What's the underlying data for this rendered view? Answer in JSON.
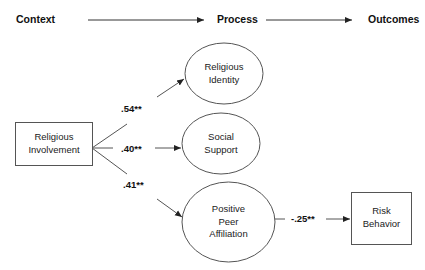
{
  "header": {
    "stages": [
      {
        "label": "Context"
      },
      {
        "label": "Process"
      },
      {
        "label": "Outcomes"
      }
    ]
  },
  "nodes": {
    "religious_involvement": {
      "line1": "Religious",
      "line2": "Involvement",
      "shape": "rectangle"
    },
    "religious_identity": {
      "line1": "Religious",
      "line2": "Identity",
      "shape": "ellipse"
    },
    "social_support": {
      "line1": "Social",
      "line2": "Support",
      "shape": "ellipse"
    },
    "positive_peer_affiliation": {
      "line1": "Positive",
      "line2": "Peer",
      "line3": "Affiliation",
      "shape": "ellipse"
    },
    "risk_behavior": {
      "line1": "Risk",
      "line2": "Behavior",
      "shape": "rectangle"
    }
  },
  "paths": [
    {
      "from": "Religious Involvement",
      "to": "Religious Identity",
      "coefficient": ".54**"
    },
    {
      "from": "Religious Involvement",
      "to": "Social Support",
      "coefficient": ".40**"
    },
    {
      "from": "Religious Involvement",
      "to": "Positive Peer Affiliation",
      "coefficient": ".41**"
    },
    {
      "from": "Positive Peer Affiliation",
      "to": "Risk Behavior",
      "coefficient": "-.25**"
    }
  ],
  "colors": {
    "stroke": "#555555",
    "text": "#1a1a1a",
    "background": "#ffffff"
  }
}
